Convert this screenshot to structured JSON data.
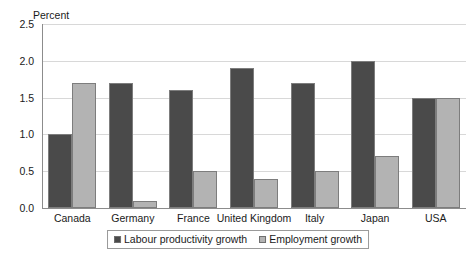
{
  "chart_data": {
    "type": "bar",
    "title": "",
    "subtitle": "",
    "xlabel": "",
    "ylabel": "Percent",
    "ylim": [
      0.0,
      2.5
    ],
    "yticks": [
      "0.0",
      "0.5",
      "1.0",
      "1.5",
      "2.0",
      "2.5"
    ],
    "ytick_values": [
      0.0,
      0.5,
      1.0,
      1.5,
      2.0,
      2.5
    ],
    "grid": true,
    "legend_position": "bottom-center",
    "categories": [
      "Canada",
      "Germany",
      "France",
      "United Kingdom",
      "Italy",
      "Japan",
      "USA"
    ],
    "series": [
      {
        "name": "Labour productivity growth",
        "color": "#4a4a4a",
        "values": [
          1.0,
          1.7,
          1.6,
          1.9,
          1.7,
          2.0,
          1.5
        ]
      },
      {
        "name": "Employment growth",
        "color": "#b3b3b3",
        "values": [
          1.7,
          0.1,
          0.5,
          0.4,
          0.5,
          0.7,
          1.5
        ]
      }
    ]
  },
  "colors": {
    "series_dark": "#4a4a4a",
    "series_light": "#b3b3b3",
    "background": "#ffffff",
    "axis": "#8c8c8c",
    "gridline": "#d8d8d8"
  }
}
